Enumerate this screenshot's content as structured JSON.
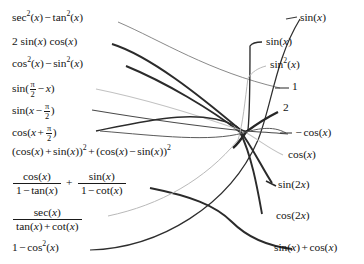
{
  "figure": {
    "kind": "matching-exercise",
    "background_color": "#ffffff",
    "ink_color": "#1a1a1a",
    "wire_color": "#333333",
    "faint_wire_color": "#b8b8b8"
  },
  "left_column": [
    {
      "id": "L1",
      "y": 18,
      "label": "sec^2(x) - tan^2(x)",
      "parts": [
        "sec",
        "2",
        "(x)",
        "-",
        "tan",
        "2",
        "(x)"
      ]
    },
    {
      "id": "L2",
      "y": 42,
      "label": "2 sin(x) cos(x)"
    },
    {
      "id": "L3",
      "y": 64,
      "label": "cos^2(x) - sin^2(x)"
    },
    {
      "id": "L4",
      "y": 86,
      "label": "sin(pi/2 - x)"
    },
    {
      "id": "L5",
      "y": 108,
      "label": "sin(x - pi/2)"
    },
    {
      "id": "L6",
      "y": 130,
      "label": "cos(x + pi/2)"
    },
    {
      "id": "L7",
      "y": 152,
      "label": "(cos(x) + sin(x))^2 + (cos(x) - sin(x))^2"
    },
    {
      "id": "L8",
      "y": 180,
      "label": "cos(x)/(1 - tan(x)) + sin(x)/(1 - cot(x))"
    },
    {
      "id": "L9",
      "y": 218,
      "label": "sec(x)/(tan(x) + cot(x))"
    },
    {
      "id": "L10",
      "y": 248,
      "label": "1 - cos^2(x)"
    }
  ],
  "right_column": [
    {
      "id": "R1",
      "y": 18,
      "label": "sin(x)"
    },
    {
      "id": "R2",
      "y": 42,
      "label": "sin(x)"
    },
    {
      "id": "R3",
      "y": 66,
      "label": "sin^2(x)"
    },
    {
      "id": "R4",
      "y": 88,
      "label": "1"
    },
    {
      "id": "R5",
      "y": 110,
      "label": "2"
    },
    {
      "id": "R6",
      "y": 133,
      "label": "- cos(x)"
    },
    {
      "id": "R7",
      "y": 155,
      "label": "cos(x)"
    },
    {
      "id": "R8",
      "y": 185,
      "label": "sin(2x)"
    },
    {
      "id": "R9",
      "y": 216,
      "label": "cos(2x)"
    },
    {
      "id": "R10",
      "y": 248,
      "label": "sin(x) + cos(x)"
    }
  ],
  "connections": [
    {
      "from": "L1",
      "to": "R4",
      "style": "thin",
      "note": "sec^2 - tan^2 = 1"
    },
    {
      "from": "L2",
      "to": "R8",
      "style": "thick",
      "note": "2 sin cos = sin(2x)"
    },
    {
      "from": "L3",
      "to": "R9",
      "style": "thick",
      "note": "cos^2 - sin^2 = cos(2x)"
    },
    {
      "from": "L4",
      "to": "R7",
      "style": "faint",
      "note": "sin(pi/2 - x) = cos(x)"
    },
    {
      "from": "L5",
      "to": "R6",
      "style": "thin",
      "note": "sin(x - pi/2) = -cos(x)"
    },
    {
      "from": "L6",
      "to": "R6b",
      "style": "thin",
      "note": "cos(x + pi/2) = -sin(x)"
    },
    {
      "from": "L7",
      "to": "R5",
      "style": "thick",
      "note": "sum of squares = 2"
    },
    {
      "from": "L8",
      "to": "R10",
      "style": "thick",
      "note": "= sin(x) + cos(x)"
    },
    {
      "from": "L9",
      "to": "R3",
      "style": "faint",
      "note": "sec/(tan+cot) = sin^2(x)"
    },
    {
      "from": "L10",
      "to": "R1",
      "style": "thick",
      "note": "1 - cos^2 = sin^2"
    }
  ]
}
